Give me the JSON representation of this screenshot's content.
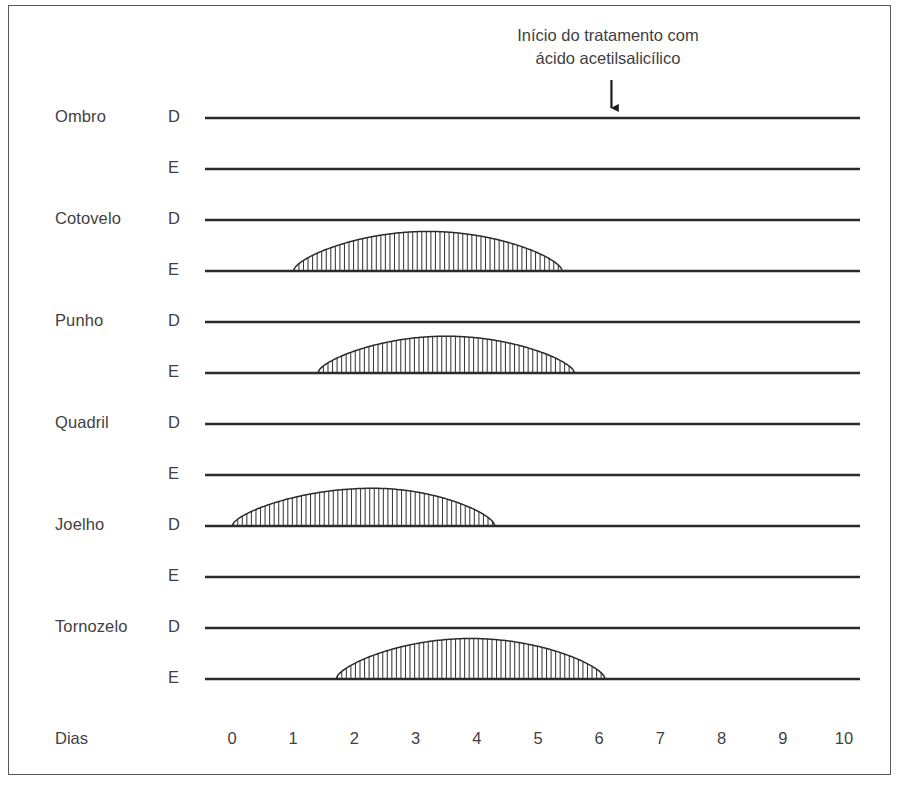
{
  "figure": {
    "annotation": {
      "line1": "Início do tratamento com",
      "line2": "ácido acetilsalicílico",
      "arrow_day": 6.2,
      "arrow_icon": "down-arrow-icon"
    },
    "axis": {
      "name": "Dias",
      "ticks": [
        "0",
        "1",
        "2",
        "3",
        "4",
        "5",
        "6",
        "7",
        "8",
        "9",
        "10"
      ]
    },
    "side_labels": {
      "right": "D",
      "left": "E"
    },
    "caption": ""
  },
  "chart_data": {
    "type": "area",
    "title": "Início do tratamento com ácido acetilsalicílico",
    "xlabel": "Dias",
    "ylabel": "",
    "xlim": [
      0,
      10
    ],
    "grid": false,
    "legend": "none",
    "xticks": [
      0,
      1,
      2,
      3,
      4,
      5,
      6,
      7,
      8,
      9,
      10
    ],
    "annotations": [
      {
        "text": "Início do tratamento com ácido acetilsalicílico",
        "x": 6.2,
        "marker": "down-arrow"
      }
    ],
    "rows": [
      {
        "joint": "Ombro",
        "side": "D",
        "side_full": "Direito",
        "episode": null
      },
      {
        "joint": "Ombro",
        "side": "E",
        "side_full": "Esquerdo",
        "episode": null
      },
      {
        "joint": "Cotovelo",
        "side": "D",
        "side_full": "Direito",
        "episode": null
      },
      {
        "joint": "Cotovelo",
        "side": "E",
        "side_full": "Esquerdo",
        "episode": {
          "start_day": 1.0,
          "end_day": 5.4,
          "peak_day": 3.2,
          "peak_height": 0.86
        }
      },
      {
        "joint": "Punho",
        "side": "D",
        "side_full": "Direito",
        "episode": null
      },
      {
        "joint": "Punho",
        "side": "E",
        "side_full": "Esquerdo",
        "episode": {
          "start_day": 1.4,
          "end_day": 5.6,
          "peak_day": 3.5,
          "peak_height": 0.8
        }
      },
      {
        "joint": "Quadril",
        "side": "D",
        "side_full": "Direito",
        "episode": null
      },
      {
        "joint": "Quadril",
        "side": "E",
        "side_full": "Esquerdo",
        "episode": null
      },
      {
        "joint": "Joelho",
        "side": "D",
        "side_full": "Direito",
        "episode": {
          "start_day": 0.0,
          "end_day": 4.3,
          "peak_day": 2.3,
          "peak_height": 0.82
        }
      },
      {
        "joint": "Joelho",
        "side": "E",
        "side_full": "Esquerdo",
        "episode": null
      },
      {
        "joint": "Tornozelo",
        "side": "D",
        "side_full": "Direito",
        "episode": null
      },
      {
        "joint": "Tornozelo",
        "side": "E",
        "side_full": "Esquerdo",
        "episode": {
          "start_day": 1.7,
          "end_day": 6.1,
          "peak_day": 3.9,
          "peak_height": 0.88
        }
      }
    ]
  }
}
